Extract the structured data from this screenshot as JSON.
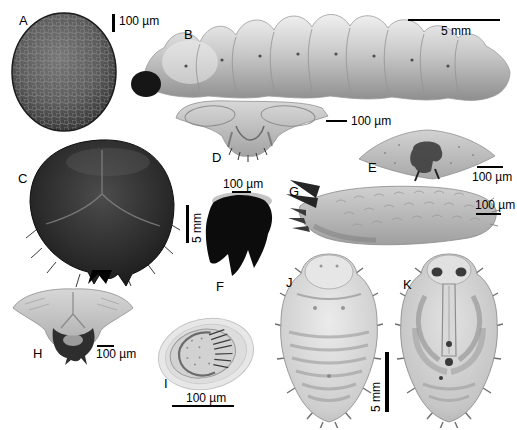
{
  "figure": {
    "background_color": "#ffffff",
    "text_color": "#000000",
    "scalebar_color": "#000000",
    "panels": {
      "a": {
        "letter": "A"
      },
      "b": {
        "letter": "B"
      },
      "c": {
        "letter": "C"
      },
      "d": {
        "letter": "D"
      },
      "e": {
        "letter": "E"
      },
      "f": {
        "letter": "F"
      },
      "g": {
        "letter": "G"
      },
      "h": {
        "letter": "H"
      },
      "i": {
        "letter": "I"
      },
      "j": {
        "letter": "J"
      },
      "k": {
        "letter": "K"
      }
    },
    "scalebars": {
      "a": {
        "text": "100 µm",
        "orientation": "vertical"
      },
      "b": {
        "text": "5 mm",
        "orientation": "horizontal"
      },
      "c": {
        "text": "5 mm",
        "orientation": "vertical"
      },
      "d": {
        "text": "100 µm",
        "orientation": "horizontal"
      },
      "e": {
        "text": "100 µm",
        "orientation": "horizontal"
      },
      "f": {
        "text": "100 µm",
        "orientation": "horizontal"
      },
      "g": {
        "text": "100 µm",
        "orientation": "horizontal"
      },
      "h": {
        "text": "100 µm",
        "orientation": "horizontal"
      },
      "i": {
        "text": "100 µm",
        "orientation": "horizontal"
      },
      "jk": {
        "text": "5 mm",
        "orientation": "vertical"
      }
    }
  }
}
